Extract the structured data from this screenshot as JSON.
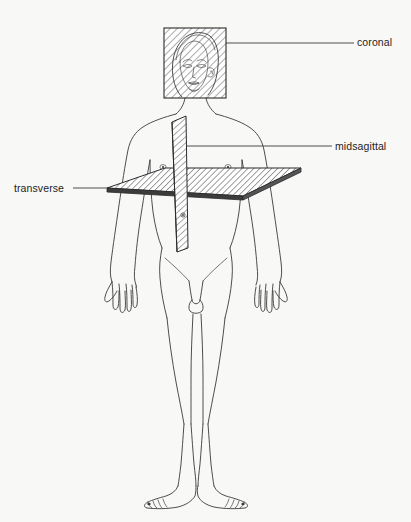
{
  "diagram": {
    "background_color": "#f8f8f7",
    "ink_color": "#2b2b2b",
    "labels": [
      {
        "id": "coronal",
        "text": "coronal",
        "text_x": 357,
        "text_y": 46,
        "leader_from_x": 226,
        "leader_from_y": 43,
        "leader_to_x": 354,
        "leader_to_y": 43,
        "anchor": "start"
      },
      {
        "id": "midsagittal",
        "text": "midsagittal",
        "text_x": 335,
        "text_y": 150,
        "leader_from_x": 187,
        "leader_from_y": 146,
        "leader_to_x": 332,
        "leader_to_y": 146,
        "anchor": "start"
      },
      {
        "id": "transverse",
        "text": "transverse",
        "text_x": 14,
        "text_y": 192,
        "leader_from_x": 108,
        "leader_from_y": 188,
        "leader_to_x": 73,
        "leader_to_y": 188,
        "anchor": "start"
      }
    ],
    "planes": [
      {
        "id": "coronal-plane",
        "name": "coronal",
        "shape": "rectangle",
        "hatch": "diagonal",
        "x": 164,
        "y": 28,
        "width": 62,
        "height": 70
      },
      {
        "id": "midsagittal-plane",
        "name": "midsagittal",
        "shape": "vertical-strip",
        "hatch": "diagonal",
        "top_y": 118,
        "bottom_y": 252
      },
      {
        "id": "transverse-plane",
        "name": "transverse",
        "shape": "parallelogram",
        "hatch": "diagonal",
        "left_x": 107,
        "right_x": 301,
        "front_y": 196,
        "back_y": 168
      }
    ],
    "figure": {
      "name": "human-body-anterior-view",
      "orientation": "anterior",
      "features": [
        "head",
        "face",
        "neck",
        "shoulders",
        "arms",
        "hands",
        "chest",
        "nipples",
        "navel",
        "pelvis",
        "legs",
        "feet"
      ]
    }
  }
}
